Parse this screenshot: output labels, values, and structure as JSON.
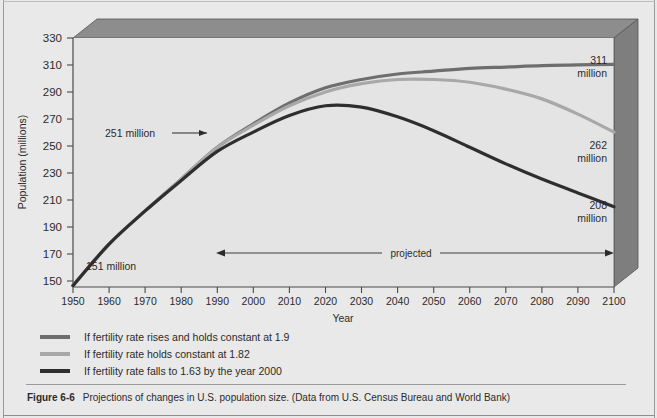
{
  "figure": {
    "number": "Figure 6-6",
    "caption": "Projections of changes in U.S. population size. (Data from U.S. Census Bureau and World Bank)"
  },
  "colors": {
    "background": "#e9e9e9",
    "plot_background": "#e4e4e4",
    "box_top_face": "#8d8d8d",
    "box_right_face": "#7e7e7e",
    "axis": "#4a4a4a",
    "series_1_9": "#6e6e6e",
    "series_1_82": "#a8a8a8",
    "series_1_63": "#2e2e2e",
    "text": "#2b2b2b"
  },
  "chart_data": {
    "type": "line",
    "title": "Projections of changes in U.S. population size",
    "xlabel": "Year",
    "ylabel": "Population (millions)",
    "xlim": [
      1950,
      2100
    ],
    "ylim": [
      150,
      330
    ],
    "xticks": [
      1950,
      1960,
      1970,
      1980,
      1990,
      2000,
      2010,
      2020,
      2030,
      2040,
      2050,
      2060,
      2070,
      2080,
      2090,
      2100
    ],
    "yticks": [
      150,
      170,
      190,
      210,
      230,
      250,
      270,
      290,
      310,
      330
    ],
    "grid": false,
    "legend_position": "below-plot",
    "x": [
      1950,
      1960,
      1970,
      1980,
      1990,
      2000,
      2010,
      2020,
      2030,
      2040,
      2050,
      2060,
      2070,
      2080,
      2090,
      2100
    ],
    "series": [
      {
        "name": "If fertility rate rises and holds constant at 1.9",
        "color": "#6e6e6e",
        "values": [
          151,
          181,
          205,
          228,
          251,
          268,
          283,
          294,
          300,
          304,
          306,
          308,
          309,
          310,
          310.5,
          311
        ]
      },
      {
        "name": "If fertility rate holds constant at 1.82",
        "color": "#a8a8a8",
        "values": [
          151,
          181,
          205,
          228,
          251,
          267,
          281,
          291,
          297,
          300,
          300,
          298,
          293,
          286,
          275,
          262
        ]
      },
      {
        "name": "If fertility rate falls to 1.63 by the year 2000",
        "color": "#2e2e2e",
        "values": [
          151,
          181,
          205,
          227,
          248,
          262,
          274,
          281,
          280,
          273,
          263,
          251,
          239,
          228,
          218,
          208
        ]
      }
    ],
    "annotations": [
      {
        "id": "start-label",
        "text": "151 million",
        "year": 1950,
        "value": 151
      },
      {
        "id": "converge-label",
        "text": "251 million",
        "year": 1990,
        "value": 251
      },
      {
        "id": "end-label-high",
        "text": "311",
        "text2": "million",
        "year": 2100,
        "value": 311
      },
      {
        "id": "end-label-mid",
        "text": "262",
        "text2": "million",
        "year": 2100,
        "value": 262
      },
      {
        "id": "end-label-low",
        "text": "208",
        "text2": "million",
        "year": 2100,
        "value": 208
      },
      {
        "id": "projected-span",
        "text": "projected",
        "from_year": 1990,
        "to_year": 2100
      }
    ]
  },
  "legend": {
    "items": [
      {
        "label": "If fertility rate rises and holds constant at 1.9",
        "color": "#6e6e6e"
      },
      {
        "label": "If fertility rate holds constant at 1.82",
        "color": "#a8a8a8"
      },
      {
        "label": "If fertility rate falls to 1.63 by the year 2000",
        "color": "#2e2e2e"
      }
    ]
  },
  "axis_labels": {
    "y_title": "Population (millions)",
    "x_title": "Year"
  },
  "labels": {
    "start": "151 million",
    "converge": "251 million",
    "high_num": "311",
    "high_unit": "million",
    "mid_num": "262",
    "mid_unit": "million",
    "low_num": "208",
    "low_unit": "million",
    "projected": "projected"
  }
}
